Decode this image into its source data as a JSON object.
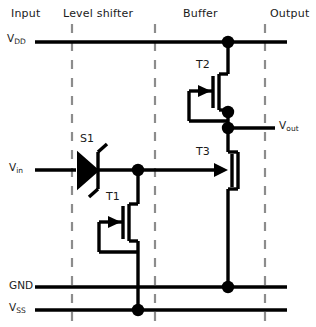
{
  "figure": {
    "kind": "circuit-schematic",
    "background": "#ffffff",
    "ink": "#000000",
    "guide_color": "#8c8c8c"
  },
  "sections": [
    {
      "id": "input",
      "label": "Input"
    },
    {
      "id": "level-shifter",
      "label": "Level shifter"
    },
    {
      "id": "buffer",
      "label": "Buffer"
    },
    {
      "id": "output",
      "label": "Output"
    }
  ],
  "nets": [
    {
      "id": "vdd",
      "label": "V",
      "sub": "DD"
    },
    {
      "id": "vin",
      "label": "V",
      "sub": "in"
    },
    {
      "id": "vout",
      "label": "V",
      "sub": "out"
    },
    {
      "id": "gnd",
      "label": "GND",
      "sub": ""
    },
    {
      "id": "vss",
      "label": "V",
      "sub": "SS"
    }
  ],
  "devices": [
    {
      "id": "s1",
      "label": "S1",
      "type": "zener-diode",
      "section": "level-shifter"
    },
    {
      "id": "t1",
      "label": "T1",
      "type": "diode-connected-mosfet",
      "section": "level-shifter"
    },
    {
      "id": "t2",
      "label": "T2",
      "type": "diode-connected-mosfet",
      "section": "buffer"
    },
    {
      "id": "t3",
      "label": "T3",
      "type": "mosfet",
      "section": "buffer"
    }
  ],
  "junctions": [
    {
      "id": "vdd-t2-drain",
      "net": "vdd"
    },
    {
      "id": "t2-source",
      "net": "vout"
    },
    {
      "id": "vout-node",
      "net": "vout"
    },
    {
      "id": "vin-t1-t3gate",
      "net": "vin"
    },
    {
      "id": "gnd-t3-source",
      "net": "gnd"
    },
    {
      "id": "vss-t1-source",
      "net": "vss"
    }
  ]
}
